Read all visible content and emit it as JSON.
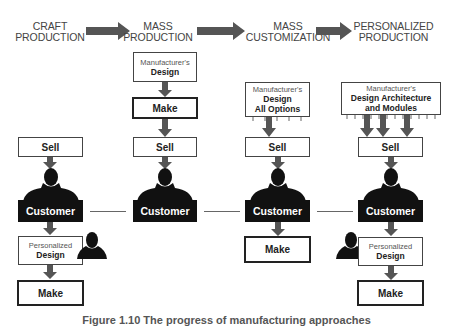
{
  "stages": [
    {
      "line1": "CRAFT",
      "line2": "PRODUCTION"
    },
    {
      "line1": "MASS",
      "line2": "PRODUCTION"
    },
    {
      "line1": "MASS",
      "line2": "CUSTOMIZATION"
    },
    {
      "line1": "PERSONALIZED",
      "line2": "PRODUCTION"
    }
  ],
  "craft": {
    "sell": "Sell",
    "customer": "Customer",
    "design_small": "Personalized",
    "design_bold": "Design",
    "make": "Make"
  },
  "mass_production": {
    "design_small": "Manufacturer's",
    "design_bold": "Design",
    "make": "Make",
    "sell": "Sell",
    "customer": "Customer"
  },
  "mass_customization": {
    "design_small": "Manufacturer's",
    "design_bold1": "Design",
    "design_bold2": "All Options",
    "sell": "Sell",
    "customer": "Customer",
    "make": "Make"
  },
  "personalized": {
    "design_small": "Manufacturer's",
    "design_bold1": "Design Architecture",
    "design_bold2": "and Modules",
    "sell": "Sell",
    "customer": "Customer",
    "design2_small": "Personalized",
    "design2_bold": "Design",
    "make": "Make"
  },
  "caption": "Figure 1.10  The progress of manufacturing approaches",
  "colors": {
    "arrow": "#555555",
    "customer_bg": "#111111",
    "border": "#444444"
  }
}
